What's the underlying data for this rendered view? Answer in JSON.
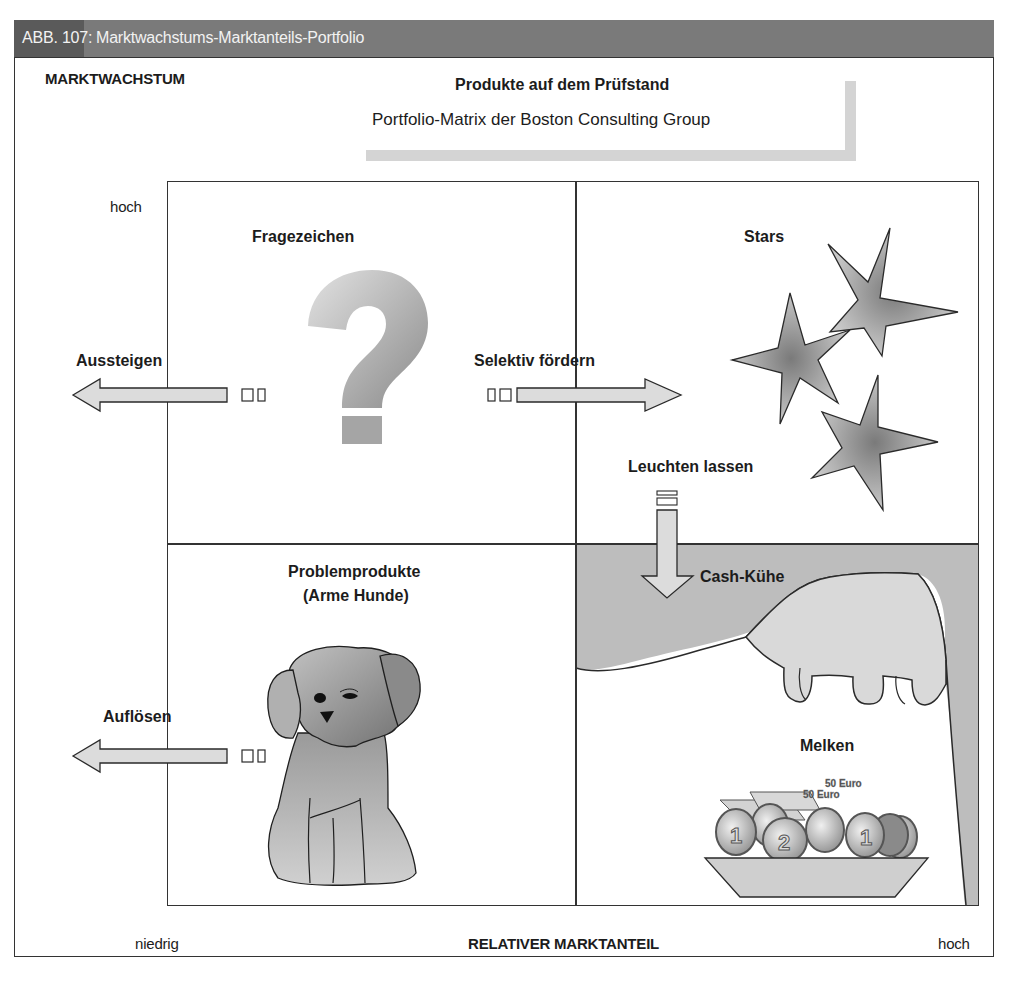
{
  "figure": {
    "number": "ABB. 107:",
    "title": "Marktwachstums-Marktanteils-Portfolio"
  },
  "heading": {
    "title": "Produkte auf dem Prüfstand",
    "subtitle": "Portfolio-Matrix der Boston Consulting Group"
  },
  "axes": {
    "y_label": "MARKTWACHSTUM",
    "y_high": "hoch",
    "x_label": "RELATIVER MARKTANTEIL",
    "x_low": "niedrig",
    "x_high": "hoch"
  },
  "quadrants": {
    "question_marks": {
      "label": "Fragezeichen",
      "icon": "question-mark-icon"
    },
    "stars": {
      "label": "Stars",
      "icon": "star-icon"
    },
    "dogs": {
      "label_line1": "Problemprodukte",
      "label_line2": "(Arme Hunde)",
      "icon": "dog-icon"
    },
    "cash_cows": {
      "label": "Cash-Kühe",
      "icon": "cow-udder-icon"
    }
  },
  "strategies": {
    "exit": "Aussteigen",
    "selective_invest": "Selektiv fördern",
    "let_shine": "Leuchten lassen",
    "divest": "Auflösen",
    "milk": "Melken"
  },
  "money_bowl": {
    "notes": [
      "50 Euro",
      "50 Euro"
    ],
    "coins": [
      "1",
      "2",
      "1"
    ]
  },
  "colors": {
    "header_dark": "#5a5a5a",
    "header_light": "#7a7a7a",
    "line": "#333333",
    "shape_fill": "#dcdcdc",
    "cow_bg": "#bdbdbd",
    "title_shadow": "#d4d4d4"
  }
}
